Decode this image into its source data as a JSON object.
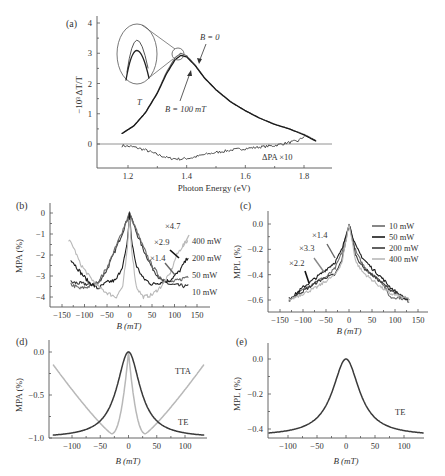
{
  "figure": {
    "panels": [
      {
        "id": "a",
        "label": "(a)"
      },
      {
        "id": "b",
        "label": "(b)"
      },
      {
        "id": "c",
        "label": "(c)"
      },
      {
        "id": "d",
        "label": "(d)"
      },
      {
        "id": "e",
        "label": "(e)"
      }
    ]
  },
  "colors": {
    "dark": "#3a3a3a",
    "black": "#1a1a1a",
    "mid": "#6a6a6a",
    "light": "#b8b8b8",
    "axis": "#555555"
  },
  "chart_data": [
    {
      "panel": "a",
      "type": "line",
      "title": "",
      "xlabel": "Photon Energy (eV)",
      "ylabel": "−10³ ΔT/T",
      "xlim": [
        1.1,
        1.9
      ],
      "ylim": [
        -0.8,
        4.2
      ],
      "xticks": [
        "1.2",
        "1.4",
        "1.6",
        "1.8"
      ],
      "yticks": [
        "0",
        "1",
        "2",
        "3",
        "4"
      ],
      "annotations": [
        "B = 0",
        "B = 100 mT",
        "T",
        "ΔPA ×10"
      ],
      "series": [
        {
          "name": "B = 0",
          "x": [
            1.18,
            1.22,
            1.26,
            1.3,
            1.33,
            1.36,
            1.38,
            1.4,
            1.43,
            1.46,
            1.5,
            1.55,
            1.6,
            1.65,
            1.7,
            1.75,
            1.8,
            1.84
          ],
          "y": [
            0.35,
            0.6,
            1.05,
            1.7,
            2.35,
            2.85,
            3.0,
            2.92,
            2.6,
            2.2,
            1.8,
            1.4,
            1.1,
            0.85,
            0.65,
            0.5,
            0.32,
            0.12
          ]
        },
        {
          "name": "B = 100 mT",
          "x": [
            1.18,
            1.22,
            1.26,
            1.3,
            1.33,
            1.36,
            1.38,
            1.4,
            1.43,
            1.46,
            1.5,
            1.55,
            1.6,
            1.65,
            1.7,
            1.75,
            1.8,
            1.84
          ],
          "y": [
            0.35,
            0.6,
            1.04,
            1.68,
            2.3,
            2.78,
            2.93,
            2.88,
            2.58,
            2.19,
            1.79,
            1.39,
            1.1,
            0.85,
            0.65,
            0.5,
            0.3,
            0.1
          ]
        },
        {
          "name": "ΔPA ×10",
          "x": [
            1.18,
            1.22,
            1.26,
            1.3,
            1.34,
            1.38,
            1.42,
            1.46,
            1.5,
            1.54,
            1.57,
            1.6,
            1.65,
            1.7,
            1.75,
            1.78,
            1.8
          ],
          "y": [
            -0.05,
            -0.1,
            -0.2,
            -0.35,
            -0.47,
            -0.5,
            -0.45,
            -0.35,
            -0.28,
            -0.22,
            -0.18,
            -0.15,
            -0.1,
            -0.05,
            0.05,
            0.1,
            0.25
          ]
        }
      ]
    },
    {
      "panel": "b",
      "type": "line",
      "xlabel": "B (mT)",
      "ylabel": "MPA (%)",
      "xlim": [
        -175,
        175
      ],
      "ylim": [
        -4.5,
        0.3
      ],
      "xticks": [
        "-150",
        "-100",
        "-50",
        "0",
        "50",
        "100",
        "150"
      ],
      "yticks": [
        "0",
        "-1",
        "-2",
        "-3",
        "-4"
      ],
      "legend": [
        "400 mW",
        "200 mW",
        "50 mW",
        "10 mW"
      ],
      "annotations": [
        "×4.7",
        "×2.9",
        "×1.4"
      ],
      "series": [
        {
          "name": "10 mW",
          "x": [
            -130,
            -110,
            -90,
            -70,
            -50,
            -30,
            -15,
            0,
            15,
            30,
            50,
            70,
            90,
            110,
            130
          ],
          "y": [
            -3.3,
            -3.35,
            -3.4,
            -3.35,
            -2.7,
            -1.7,
            -0.9,
            0,
            -0.9,
            -1.7,
            -2.6,
            -3.2,
            -3.4,
            -3.45,
            -3.5
          ]
        },
        {
          "name": "50 mW",
          "x": [
            -130,
            -110,
            -90,
            -70,
            -50,
            -30,
            -15,
            0,
            15,
            30,
            50,
            70,
            90,
            110,
            130
          ],
          "y": [
            -3.4,
            -3.6,
            -3.5,
            -3.3,
            -2.6,
            -1.6,
            -0.8,
            0,
            -0.8,
            -1.6,
            -2.5,
            -3.1,
            -3.3,
            -3.2,
            -3.0
          ]
        },
        {
          "name": "200 mW",
          "x": [
            -130,
            -110,
            -90,
            -70,
            -50,
            -30,
            -15,
            -5,
            0,
            5,
            15,
            30,
            50,
            70,
            90,
            110,
            130
          ],
          "y": [
            -2.2,
            -2.8,
            -3.3,
            -3.6,
            -3.3,
            -3.2,
            -2.5,
            -1.5,
            0,
            -1.4,
            -2.5,
            -3.1,
            -3.4,
            -3.3,
            -3.2,
            -2.8,
            -2.1
          ]
        },
        {
          "name": "400 mW",
          "x": [
            -135,
            -125,
            -110,
            -90,
            -70,
            -50,
            -30,
            -15,
            -5,
            0,
            5,
            15,
            30,
            50,
            70,
            90,
            105,
            120,
            130
          ],
          "y": [
            -1.3,
            -1.6,
            -2.4,
            -3.0,
            -3.5,
            -3.8,
            -4.0,
            -3.5,
            -1.8,
            0,
            -1.8,
            -3.5,
            -4.0,
            -3.9,
            -3.5,
            -2.9,
            -2.0,
            -1.5,
            -1.3
          ]
        }
      ]
    },
    {
      "panel": "c",
      "type": "line",
      "xlabel": "B (mT)",
      "ylabel": "MPL (%)",
      "xlim": [
        -175,
        175
      ],
      "ylim": [
        -0.7,
        0.1
      ],
      "xticks": [
        "-150",
        "-100",
        "-50",
        "0",
        "50",
        "100",
        "150"
      ],
      "yticks": [
        "0.0",
        "-0.2",
        "-0.4",
        "-0.6"
      ],
      "legend": [
        "10 mW",
        "50 mW",
        "200 mW",
        "400 mW"
      ],
      "annotations": [
        "×1.4",
        "×3.3",
        "×2.2"
      ],
      "series": [
        {
          "name": "10 mW",
          "x": [
            -130,
            -100,
            -70,
            -50,
            -30,
            -15,
            0,
            15,
            30,
            50,
            70,
            90,
            110,
            130
          ],
          "y": [
            -0.6,
            -0.52,
            -0.45,
            -0.42,
            -0.35,
            -0.22,
            0,
            -0.22,
            -0.32,
            -0.4,
            -0.45,
            -0.58,
            -0.58,
            -0.61
          ]
        },
        {
          "name": "50 mW",
          "x": [
            -130,
            -100,
            -70,
            -50,
            -30,
            -15,
            0,
            15,
            30,
            50,
            70,
            90,
            110,
            130
          ],
          "y": [
            -0.6,
            -0.5,
            -0.42,
            -0.36,
            -0.3,
            -0.2,
            0,
            -0.18,
            -0.27,
            -0.35,
            -0.42,
            -0.5,
            -0.56,
            -0.61
          ]
        },
        {
          "name": "200 mW",
          "x": [
            -130,
            -100,
            -70,
            -50,
            -30,
            -15,
            0,
            15,
            30,
            50,
            70,
            90,
            110,
            130
          ],
          "y": [
            -0.59,
            -0.53,
            -0.46,
            -0.42,
            -0.4,
            -0.28,
            0,
            -0.25,
            -0.34,
            -0.4,
            -0.46,
            -0.52,
            -0.56,
            -0.6
          ]
        },
        {
          "name": "400 mW",
          "x": [
            -130,
            -100,
            -70,
            -50,
            -30,
            -15,
            0,
            15,
            30,
            50,
            70,
            90,
            110,
            130
          ],
          "y": [
            -0.6,
            -0.55,
            -0.5,
            -0.45,
            -0.4,
            -0.3,
            0,
            -0.3,
            -0.38,
            -0.44,
            -0.5,
            -0.55,
            -0.57,
            -0.59
          ]
        }
      ]
    },
    {
      "panel": "d",
      "type": "line",
      "xlabel": "B (mT)",
      "ylabel": "MPA (%)",
      "xlim": [
        -135,
        135
      ],
      "ylim": [
        -1.0,
        0.1
      ],
      "xticks": [
        "-100",
        "-50",
        "0",
        "50",
        "100"
      ],
      "yticks": [
        "0.0",
        "-0.5",
        "-1.0"
      ],
      "annotations": [
        "TTA",
        "TE"
      ],
      "series": [
        {
          "name": "TE",
          "model": "lorentzian",
          "amplitude": -1.0,
          "width": 25,
          "offset": 0
        },
        {
          "name": "TTA",
          "model": "tta",
          "amplitude": -0.95,
          "width": 30
        }
      ]
    },
    {
      "panel": "e",
      "type": "line",
      "xlabel": "B (mT)",
      "ylabel": "MPL (%)",
      "xlim": [
        -135,
        135
      ],
      "ylim": [
        -0.42,
        0.04
      ],
      "xticks": [
        "-100",
        "-50",
        "0",
        "50",
        "100"
      ],
      "yticks": [
        "0.0",
        "-0.2",
        "-0.4"
      ],
      "annotations": [
        "TE"
      ],
      "series": [
        {
          "name": "TE",
          "model": "lorentzian",
          "amplitude": -0.42,
          "width": 28,
          "offset": 0
        }
      ]
    }
  ]
}
